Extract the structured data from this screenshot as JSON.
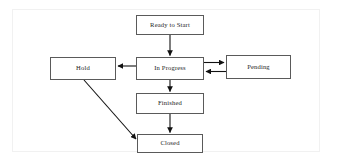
{
  "diagram": {
    "background_color": "#ffffff",
    "node_fill": "#ffffff",
    "node_border_color": "#5a5a5a",
    "edge_color": "#111111",
    "nodes": [
      {
        "id": "ready",
        "label": "Ready to Start",
        "x": 136,
        "y": 15,
        "w": 68,
        "h": 20
      },
      {
        "id": "hold",
        "label": "Hold",
        "x": 50,
        "y": 57,
        "w": 66,
        "h": 23
      },
      {
        "id": "progress",
        "label": "In Progress",
        "x": 136,
        "y": 57,
        "w": 68,
        "h": 23
      },
      {
        "id": "pending",
        "label": "Pending",
        "x": 226,
        "y": 55,
        "w": 65,
        "h": 24
      },
      {
        "id": "finished",
        "label": "Finished",
        "x": 136,
        "y": 93,
        "w": 68,
        "h": 21
      },
      {
        "id": "closed",
        "label": "Closed",
        "x": 137,
        "y": 134,
        "w": 66,
        "h": 19
      }
    ],
    "edges": [
      {
        "id": "ready-to-progress",
        "from": "ready",
        "to": "progress",
        "kind": "vertical",
        "arrow": "end"
      },
      {
        "id": "progress-to-hold",
        "from": "progress",
        "to": "hold",
        "kind": "horizontal",
        "arrow": "end"
      },
      {
        "id": "progress-to-pending",
        "from": "progress",
        "to": "pending",
        "kind": "horizontal",
        "arrow": "end"
      },
      {
        "id": "pending-to-progress",
        "from": "pending",
        "to": "progress",
        "kind": "horizontal",
        "arrow": "end"
      },
      {
        "id": "progress-to-finished",
        "from": "progress",
        "to": "finished",
        "kind": "vertical",
        "arrow": "end"
      },
      {
        "id": "finished-to-closed",
        "from": "finished",
        "to": "closed",
        "kind": "vertical",
        "arrow": "end"
      },
      {
        "id": "hold-to-closed",
        "from": "hold",
        "to": "closed",
        "kind": "diagonal",
        "arrow": "end"
      }
    ]
  }
}
